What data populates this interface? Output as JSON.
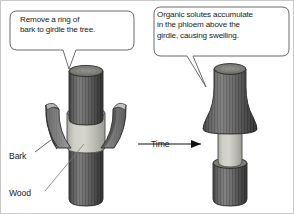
{
  "figure": {
    "background_color": "#ffffff",
    "border_color": "#c8c8c8",
    "width": 294,
    "height": 214
  },
  "callouts": [
    {
      "name": "callout-left",
      "text": "Remove a ring of\nbark to girdle the tree.",
      "fill": "#ffffff",
      "stroke": "#555555"
    },
    {
      "name": "callout-right",
      "text": "Organic solutes accumulate\nin the phloem above the\ngirdle, causing swelling.",
      "fill": "#ffffff",
      "stroke": "#555555"
    }
  ],
  "labels": {
    "bark": "Bark",
    "wood": "Wood",
    "time": "Time"
  },
  "colors": {
    "bark_dark": "#4a4a4a",
    "bark_mid": "#6e6e6e",
    "bark_light": "#8e8e8e",
    "wood_light": "#c9c9c2",
    "wood_shadow": "#a7a7a0",
    "outline": "#2b2b2b",
    "text": "#1a1a1a",
    "arrow": "#111111"
  },
  "stages": [
    {
      "name": "stage-before",
      "caption": "Tree trunk with a ring of bark removed, bark flaps peeled outward exposing the wood."
    },
    {
      "name": "stage-after",
      "caption": "Same trunk after time: bark above the girdle has swollen, exposed wood band remains."
    }
  ]
}
